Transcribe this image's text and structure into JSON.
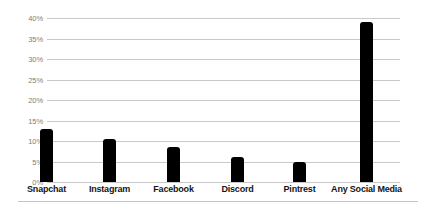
{
  "chart_data": {
    "type": "bar",
    "title": "",
    "subtitle": "",
    "xlabel": "",
    "ylabel": "",
    "categories": [
      "Snapchat",
      "Instagram",
      "Facebook",
      "Discord",
      "Pintrest",
      "Any Social Media"
    ],
    "values": [
      13,
      10.5,
      8.5,
      6,
      5,
      39
    ],
    "value_labels": [
      "13%",
      "10.5%",
      "8.5%",
      "6%",
      "5%",
      "39%"
    ],
    "ylim": [
      0,
      40
    ],
    "y_tick_values": [
      40,
      35,
      30,
      25,
      20,
      15,
      10,
      5,
      0
    ],
    "y_tick_labels": [
      "40%",
      "35%",
      "30%",
      "25%",
      "20%",
      "15%",
      "10%",
      "5%",
      "0%"
    ],
    "grid": true,
    "grid_axis": "y",
    "legend": false,
    "legend_position": "none",
    "bar_color": "#000000",
    "grid_color": "#c9c9c9",
    "tick_label_color": "#7d7d7d",
    "category_label_color": "#151515",
    "background_color": "#ffffff"
  }
}
